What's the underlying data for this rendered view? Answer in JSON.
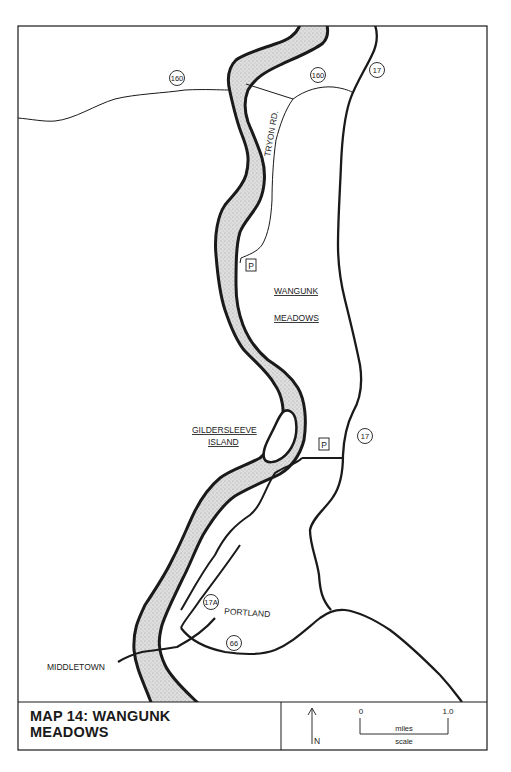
{
  "map": {
    "title": "MAP 14:  WANGUNK MEADOWS",
    "title_line1": "MAP 14:  WANGUNK",
    "title_line2": "MEADOWS",
    "labels": {
      "tryon_rd": "TRYON RD.",
      "wangunk": "WANGUNK",
      "meadows": "MEADOWS",
      "gildersleeve": "GILDERSLEEVE",
      "island": "ISLAND",
      "portland": "PORTLAND",
      "middletown": "MIDDLETOWN"
    },
    "route_shields": {
      "r160_west": "160",
      "r160_east": "160",
      "r17_north": "17",
      "r17_south": "17",
      "r17a": "17A",
      "r66": "66"
    },
    "parking": {
      "north": "P",
      "south": "P"
    },
    "legend": {
      "north_label": "N",
      "scale_start": "0",
      "scale_end": "1.0",
      "scale_unit": "miles",
      "scale_caption": "scale"
    },
    "colors": {
      "ink": "#1a1a1a",
      "river_fill": "#d4d4d4",
      "background": "#ffffff"
    }
  }
}
